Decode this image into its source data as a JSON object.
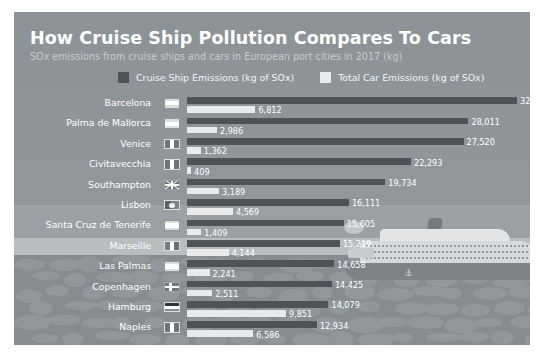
{
  "card": {
    "title": "How Cruise Ship Pollution Compares To Cars",
    "subtitle": "SOx emissions from cruise ships and cars in European port cities in 2017 (kg)"
  },
  "legend": {
    "items": [
      {
        "label": "Cruise Ship Emissions (kg of SOx)",
        "color": "#4e5357",
        "icon": "legend-swatch-cruise"
      },
      {
        "label": "Total Car Emissions (kg of SOx)",
        "color": "#e8eaeb",
        "icon": "legend-swatch-car"
      }
    ]
  },
  "illustration": {
    "name": "cruise-ship-illustration",
    "anchor_glyph": "⚓"
  },
  "chart_data": {
    "type": "bar",
    "orientation": "horizontal",
    "title": "How Cruise Ship Pollution Compares To Cars",
    "subtitle": "SOx emissions from cruise ships and cars in European port cities in 2017 (kg)",
    "xlabel": "",
    "ylabel": "",
    "grid": false,
    "legend_position": "top",
    "xlim": [
      0,
      32838
    ],
    "categories": [
      "Barcelona",
      "Palma de Mallorca",
      "Venice",
      "Civitavecchia",
      "Southampton",
      "Lisbon",
      "Santa Cruz de Tenerife",
      "Marseille",
      "Las Palmas",
      "Copenhagen",
      "Hamburg",
      "Naples"
    ],
    "country_flags": [
      "spain",
      "spain",
      "italy",
      "italy",
      "united-kingdom",
      "portugal",
      "spain",
      "france",
      "spain",
      "denmark",
      "germany",
      "italy"
    ],
    "series": [
      {
        "name": "Cruise Ship Emissions (kg of SOx)",
        "color": "#4e5357",
        "values": [
          32838,
          28011,
          27520,
          22293,
          19734,
          16111,
          15605,
          15219,
          14658,
          14425,
          14079,
          12934
        ],
        "labels": [
          "32,838",
          "28,011",
          "27,520",
          "22,293",
          "19,734",
          "16,111",
          "15,605",
          "15,219",
          "14,658",
          "14,425",
          "14,079",
          "12,934"
        ]
      },
      {
        "name": "Total Car Emissions (kg of SOx)",
        "color": "#e8eaeb",
        "values": [
          6812,
          2986,
          1362,
          409,
          3189,
          4569,
          1409,
          4144,
          2241,
          2511,
          9851,
          6586
        ],
        "labels": [
          "6,812",
          "2,986",
          "1,362",
          "409",
          "3,189",
          "4,569",
          "1,409",
          "4,144",
          "2,241",
          "2,511",
          "9,851",
          "6,586"
        ]
      }
    ]
  }
}
